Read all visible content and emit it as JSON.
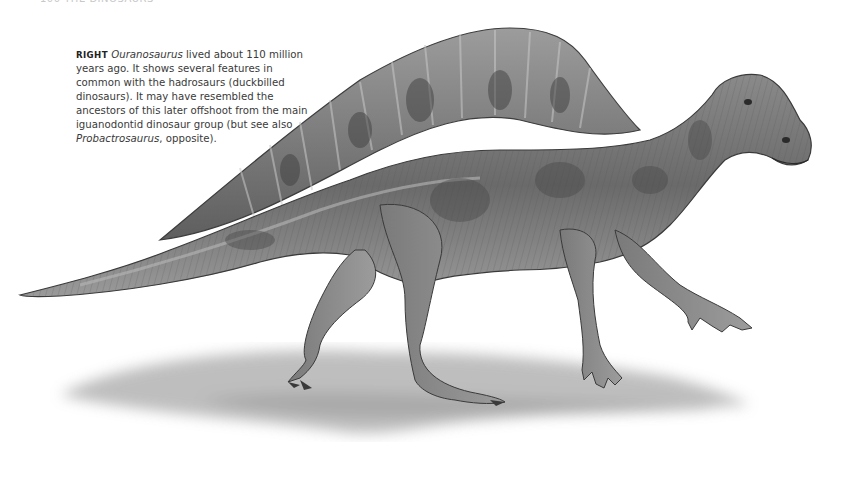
{
  "page": {
    "header_fragment": "100 THE DINOSAURS"
  },
  "caption": {
    "kicker": "RIGHT",
    "genus": "Ouranosaurus",
    "text_1": " lived about 110 million years ago. It shows several features in common with the hadrosaurs (duckbilled dinosaurs). It may have resembled the ancestors of this later offshoot from the main iguanodontid dinosaur group (but see also ",
    "genus_2": "Probactrosaurus",
    "text_2": ", opposite)."
  },
  "illustration": {
    "subject": "Ouranosaurus",
    "style": "grayscale pencil illustration",
    "colors": {
      "body_dark": "#4a4a4a",
      "body_mid": "#7a7a7a",
      "body_light": "#a8a8a8",
      "shadow": "#b5b5b5",
      "background": "#ffffff"
    }
  }
}
